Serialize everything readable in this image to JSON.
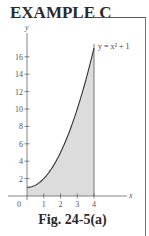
{
  "header": {
    "title": "EXAMPLE C"
  },
  "caption": "Fig. 24-5(a)",
  "colors": {
    "ink": "#333333",
    "shade": "#d9d9d9",
    "axis": "#666666"
  },
  "chart_data": {
    "type": "area",
    "title": "EXAMPLE C",
    "caption": "Fig. 24-5(a)",
    "xlabel": "x",
    "ylabel": "y",
    "annotation": "y = x² + 1",
    "function": "y = x^2 + 1",
    "shaded_region": {
      "x_from": 0,
      "x_to": 4,
      "description": "area under y = x^2 + 1 between x = 0 and x = 4"
    },
    "x_ticks": [
      "0",
      "1",
      "2",
      "3",
      "4"
    ],
    "y_ticks": [
      "2",
      "4",
      "6",
      "8",
      "10",
      "12",
      "16",
      "14"
    ],
    "xlim": [
      0,
      5.9
    ],
    "ylim": [
      0,
      19
    ],
    "grid": false,
    "x": [
      0,
      0.5,
      1,
      1.5,
      2,
      2.5,
      3,
      3.5,
      4
    ],
    "series": [
      {
        "name": "y = x^2 + 1",
        "values": [
          1,
          1.25,
          2,
          3.25,
          5,
          7.25,
          10,
          13.25,
          17
        ]
      }
    ]
  },
  "labels": {
    "y_axis": "y",
    "x_axis": "x",
    "origin": "0",
    "curve": "y = x² + 1",
    "y_tick_values": [
      "2",
      "4",
      "6",
      "8",
      "10",
      "12",
      "14",
      "16"
    ],
    "x_tick_values": [
      "1",
      "2",
      "3",
      "4"
    ]
  }
}
